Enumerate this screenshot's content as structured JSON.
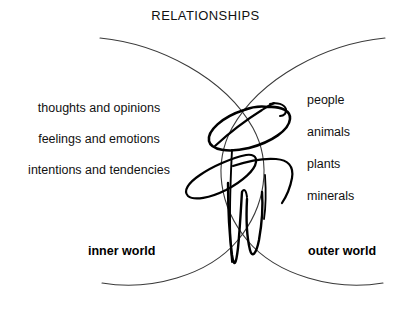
{
  "diagram": {
    "title": "RELATIONSHIPS",
    "inner": {
      "label": "inner world",
      "items": [
        "thoughts and opinions",
        "feelings and emotions",
        "intentions and tendencies"
      ]
    },
    "outer": {
      "label": "outer world",
      "items": [
        "people",
        "animals",
        "plants",
        "minerals"
      ]
    },
    "graphics": {
      "left_arc": "thin-circle-arc-left",
      "right_arc": "thin-circle-arc-right",
      "central_figure": "calligraphic-human-scribble"
    },
    "colors": {
      "background": "#ffffff",
      "text": "#111111",
      "arc_stroke": "#3a3a3a",
      "figure_stroke": "#000000"
    }
  }
}
